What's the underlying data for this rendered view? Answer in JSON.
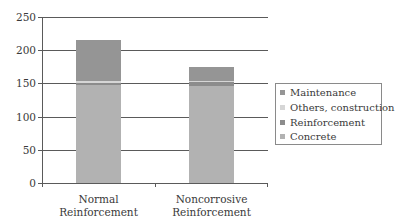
{
  "chart_data": {
    "type": "bar",
    "stacked": true,
    "title": "",
    "xlabel": "",
    "ylabel": "",
    "ylim": [
      0,
      250
    ],
    "yticks": [
      0,
      50,
      100,
      150,
      200,
      250
    ],
    "grid": true,
    "legend_position": "right",
    "categories": [
      "Normal Reinforcement",
      "Noncorrosive Reinforcement"
    ],
    "category_lines": [
      [
        "Normal",
        "Reinforcement"
      ],
      [
        "Noncorrosive",
        "Reinforcement"
      ]
    ],
    "series": [
      {
        "name": "Concrete",
        "color": "#b2b2b2",
        "values": [
          147,
          146
        ]
      },
      {
        "name": "Reinforcement",
        "color": "#8c8c8c",
        "values": [
          3,
          7
        ]
      },
      {
        "name": "Others, construction",
        "color": "#d6d6d6",
        "values": [
          4,
          1
        ]
      },
      {
        "name": "Maintenance",
        "color": "#959595",
        "values": [
          62,
          20
        ]
      }
    ],
    "totals": [
      216,
      174
    ]
  },
  "legend": {
    "items": [
      {
        "label": "Maintenance",
        "color": "#959595"
      },
      {
        "label": "Others, construction",
        "color": "#d6d6d6"
      },
      {
        "label": "Reinforcement",
        "color": "#8c8c8c"
      },
      {
        "label": "Concrete",
        "color": "#b2b2b2"
      }
    ]
  },
  "axis": {
    "y_labels": [
      "250",
      "200",
      "150",
      "100",
      "50",
      "0"
    ]
  }
}
